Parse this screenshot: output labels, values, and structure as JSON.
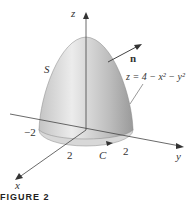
{
  "figure": {
    "caption": "FIGURE 2",
    "surface_label": "S",
    "normal_label": "n",
    "equation": "z = 4 − x² − y²",
    "curve_label": "C",
    "axes": {
      "x": "x",
      "y": "y",
      "z": "z"
    },
    "ticks": {
      "neg_two": "−2",
      "x_two": "2",
      "y_two": "2"
    }
  },
  "colors": {
    "surface_light": "#e8e8e8",
    "surface_dark": "#a8a8a8",
    "axis": "#444444",
    "base": "#d0d0d0"
  }
}
